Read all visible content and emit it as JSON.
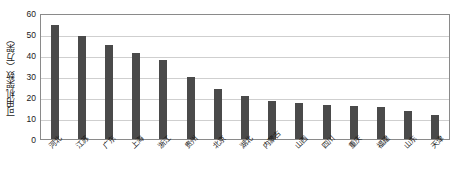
{
  "chart_data": {
    "type": "bar",
    "title": "",
    "xlabel": "",
    "ylabel": "可用机架数（万架）",
    "ylim": [
      0,
      60
    ],
    "yticks": [
      0,
      10,
      20,
      30,
      40,
      50,
      60
    ],
    "grid": true,
    "legend": null,
    "bar_color": "#4a4a4a",
    "categories": [
      "河北",
      "江苏",
      "广东",
      "上海",
      "浙江",
      "贵州",
      "北京",
      "湖北",
      "内蒙古",
      "山西",
      "四川",
      "重庆",
      "福建",
      "山东",
      "天津"
    ],
    "values": [
      54.5,
      49.0,
      44.8,
      41.0,
      37.8,
      29.5,
      24.0,
      20.5,
      18.3,
      17.0,
      16.3,
      15.6,
      15.3,
      13.2,
      11.5
    ]
  }
}
